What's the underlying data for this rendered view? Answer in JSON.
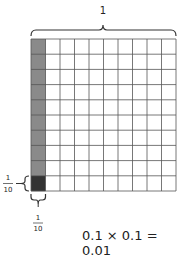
{
  "diagram": {
    "top_label": "1",
    "left_fraction": {
      "numerator": "1",
      "denominator": "10"
    },
    "bottom_fraction": {
      "numerator": "1",
      "denominator": "10"
    },
    "equation": "0.1 × 0.1 = 0.01",
    "grid": {
      "rows": 10,
      "cols": 10,
      "shaded_column": 1,
      "highlighted_cell": {
        "row": 10,
        "col": 1
      }
    },
    "colors": {
      "column_shade": "#8a8a8a",
      "highlight_cell": "#333333",
      "grid_line": "#555555",
      "cell_fill": "#ffffff"
    }
  }
}
